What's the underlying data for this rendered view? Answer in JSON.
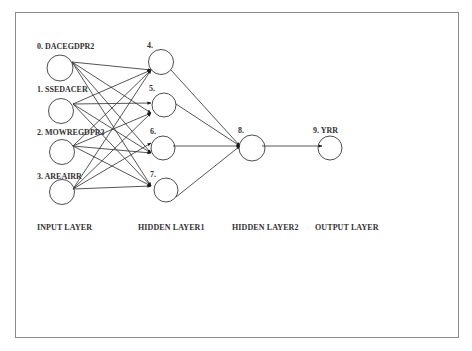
{
  "diagram": {
    "type": "neural-network",
    "colors": {
      "edge": "#2b2b2b",
      "node_stroke": "#3a3a3a",
      "node_fill": "#ffffff",
      "frame": "#8a8a8a",
      "text": "#333333"
    },
    "layers": [
      {
        "id": "input",
        "label": "INPUT LAYER",
        "x": 37
      },
      {
        "id": "hidden1",
        "label": "HIDDEN LAYER1",
        "x": 138
      },
      {
        "id": "hidden2",
        "label": "HIDDEN LAYER2",
        "x": 232
      },
      {
        "id": "output",
        "label": "OUTPUT LAYER",
        "x": 315
      }
    ],
    "nodes": [
      {
        "id": 0,
        "label": "0. DACEGDPR2",
        "layer": "input",
        "cx": 60,
        "cy": 68,
        "r": 13,
        "lx": 37,
        "ly": 43
      },
      {
        "id": 1,
        "label": "1. SSEDACER",
        "layer": "input",
        "cx": 61,
        "cy": 111,
        "r": 12.5,
        "lx": 37,
        "ly": 86
      },
      {
        "id": 2,
        "label": "2. MOWREGDPR3",
        "layer": "input",
        "cx": 62,
        "cy": 152,
        "r": 12.5,
        "lx": 37,
        "ly": 129
      },
      {
        "id": 3,
        "label": "3. AREAIRR",
        "layer": "input",
        "cx": 62,
        "cy": 192,
        "r": 12.5,
        "lx": 37,
        "ly": 173
      },
      {
        "id": 4,
        "label": "4.",
        "layer": "hidden1",
        "cx": 161,
        "cy": 62,
        "r": 12.5,
        "lx": 147,
        "ly": 42
      },
      {
        "id": 5,
        "label": "5.",
        "layer": "hidden1",
        "cx": 164,
        "cy": 105,
        "r": 12,
        "lx": 149,
        "ly": 85
      },
      {
        "id": 6,
        "label": "6.",
        "layer": "hidden1",
        "cx": 163,
        "cy": 148,
        "r": 12,
        "lx": 150,
        "ly": 128
      },
      {
        "id": 7,
        "label": "7.",
        "layer": "hidden1",
        "cx": 166,
        "cy": 190,
        "r": 12,
        "lx": 150,
        "ly": 171
      },
      {
        "id": 8,
        "label": "8.",
        "layer": "hidden2",
        "cx": 252,
        "cy": 148,
        "r": 13,
        "lx": 238,
        "ly": 127
      },
      {
        "id": 9,
        "label": "9.  YRR",
        "layer": "output",
        "cx": 330,
        "cy": 148,
        "r": 12,
        "lx": 313,
        "ly": 127
      }
    ],
    "edges": [
      {
        "from": 0,
        "to": 4,
        "x1": 72,
        "y1": 62,
        "x2": 151,
        "y2": 70
      },
      {
        "from": 0,
        "to": 5,
        "x1": 72,
        "y1": 62,
        "x2": 151,
        "y2": 113
      },
      {
        "from": 0,
        "to": 6,
        "x1": 72,
        "y1": 62,
        "x2": 151,
        "y2": 153
      },
      {
        "from": 0,
        "to": 7,
        "x1": 72,
        "y1": 62,
        "x2": 151,
        "y2": 186
      },
      {
        "from": 1,
        "to": 4,
        "x1": 73,
        "y1": 104,
        "x2": 151,
        "y2": 70
      },
      {
        "from": 1,
        "to": 5,
        "x1": 73,
        "y1": 104,
        "x2": 151,
        "y2": 103
      },
      {
        "from": 1,
        "to": 6,
        "x1": 73,
        "y1": 104,
        "x2": 151,
        "y2": 153
      },
      {
        "from": 1,
        "to": 7,
        "x1": 73,
        "y1": 104,
        "x2": 151,
        "y2": 186
      },
      {
        "from": 2,
        "to": 4,
        "x1": 73,
        "y1": 146,
        "x2": 151,
        "y2": 70
      },
      {
        "from": 2,
        "to": 5,
        "x1": 73,
        "y1": 146,
        "x2": 151,
        "y2": 113
      },
      {
        "from": 2,
        "to": 6,
        "x1": 73,
        "y1": 146,
        "x2": 151,
        "y2": 153
      },
      {
        "from": 2,
        "to": 7,
        "x1": 73,
        "y1": 146,
        "x2": 151,
        "y2": 186
      },
      {
        "from": 3,
        "to": 4,
        "x1": 73,
        "y1": 189,
        "x2": 151,
        "y2": 70
      },
      {
        "from": 3,
        "to": 5,
        "x1": 73,
        "y1": 189,
        "x2": 151,
        "y2": 113
      },
      {
        "from": 3,
        "to": 6,
        "x1": 73,
        "y1": 189,
        "x2": 151,
        "y2": 143
      },
      {
        "from": 3,
        "to": 7,
        "x1": 73,
        "y1": 189,
        "x2": 151,
        "y2": 186
      },
      {
        "from": 4,
        "to": 8,
        "x1": 171,
        "y1": 70,
        "x2": 240,
        "y2": 146
      },
      {
        "from": 5,
        "to": 8,
        "x1": 176,
        "y1": 104,
        "x2": 240,
        "y2": 146
      },
      {
        "from": 6,
        "to": 8,
        "x1": 173,
        "y1": 146,
        "x2": 240,
        "y2": 146
      },
      {
        "from": 7,
        "to": 8,
        "x1": 176,
        "y1": 197,
        "x2": 240,
        "y2": 146
      },
      {
        "from": 8,
        "to": 9,
        "x1": 262,
        "y1": 146,
        "x2": 322,
        "y2": 146
      }
    ]
  }
}
